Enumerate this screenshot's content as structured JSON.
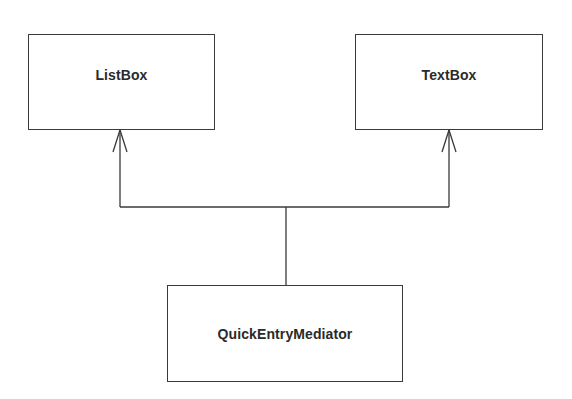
{
  "diagram": {
    "type": "UML class diagram",
    "classes": [
      {
        "id": "listbox",
        "name": "ListBox"
      },
      {
        "id": "textbox",
        "name": "TextBox"
      },
      {
        "id": "mediator",
        "name": "QuickEntryMediator"
      }
    ],
    "relationships": [
      {
        "from": "QuickEntryMediator",
        "to": "ListBox",
        "kind": "association",
        "arrow": "open"
      },
      {
        "from": "QuickEntryMediator",
        "to": "TextBox",
        "kind": "association",
        "arrow": "open"
      }
    ],
    "colors": {
      "line": "#3a3a3a",
      "text": "#2a2a2a",
      "background": "#ffffff"
    }
  }
}
